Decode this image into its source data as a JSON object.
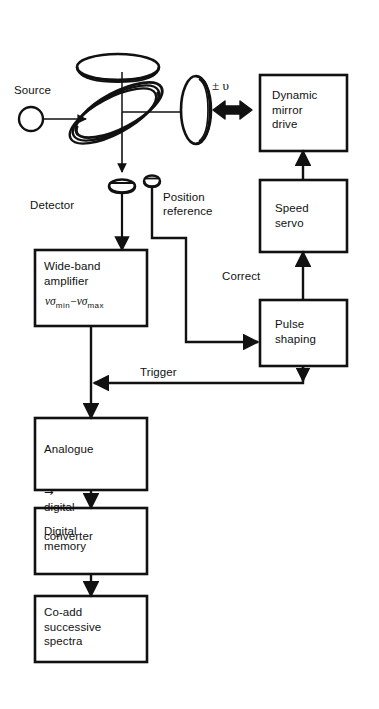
{
  "figure": {
    "background": "#ffffff",
    "line_color": "#111111"
  },
  "optics": {
    "source": {
      "label": "Source",
      "icon": "source-circle-icon"
    },
    "beamsplitter": {
      "icon": "beamsplitter-disc-icon"
    },
    "fixed_mirror": {
      "icon": "fixed-mirror-disc-icon"
    },
    "moving_mirror": {
      "icon": "moving-mirror-disc-icon"
    },
    "velocity_label": {
      "sign": "±",
      "symbol": "υ",
      "text": "± υ"
    },
    "scan_arrow": {
      "icon": "double-headed-arrow-icon"
    },
    "detector": {
      "label": "Detector",
      "icon": "detector-icon"
    },
    "position_reference": {
      "label": "Position\nreference",
      "icon": "position-reference-icon"
    }
  },
  "blocks": [
    {
      "id": "wide-band-amplifier",
      "label": "Wide-band\namplifier",
      "formula": {
        "left_symbol": "νσ",
        "left_sub": "min",
        "operator": "−",
        "right_symbol": "νσ",
        "right_sub": "max",
        "text": "νσmin−νσmax"
      }
    },
    {
      "id": "analogue-digital-converter",
      "label": "Analogue\n→ digital\nconverter",
      "line1": "Analogue",
      "line2_arrow": "→",
      "line2_text": "digital",
      "line3": "converter"
    },
    {
      "id": "digital-memory",
      "label": "Digital\nmemory"
    },
    {
      "id": "co-add-successive-spectra",
      "label": "Co-add\nsuccessive\nspectra"
    },
    {
      "id": "dynamic-mirror-drive",
      "label": "Dynamic\nmirror\ndrive"
    },
    {
      "id": "speed-servo",
      "label": "Speed\nservo"
    },
    {
      "id": "pulse-shaping",
      "label": "Pulse\nshaping"
    }
  ],
  "connections": [
    {
      "id": "trigger",
      "label": "Trigger",
      "from": "pulse-shaping",
      "to": "amplifier-output-line"
    },
    {
      "id": "correct",
      "label": "Correct",
      "from": "pulse-shaping",
      "to": "speed-servo"
    },
    {
      "id": "position-to-pulse",
      "label": "",
      "from": "position-reference",
      "to": "pulse-shaping"
    },
    {
      "id": "servo-to-drive",
      "label": "",
      "from": "speed-servo",
      "to": "dynamic-mirror-drive"
    },
    {
      "id": "detector-to-amp",
      "label": "",
      "from": "detector",
      "to": "wide-band-amplifier"
    },
    {
      "id": "amp-to-adc",
      "label": "",
      "from": "wide-band-amplifier",
      "to": "analogue-digital-converter"
    },
    {
      "id": "adc-to-memory",
      "label": "",
      "from": "analogue-digital-converter",
      "to": "digital-memory"
    },
    {
      "id": "memory-to-coadd",
      "label": "",
      "from": "digital-memory",
      "to": "co-add-successive-spectra"
    },
    {
      "id": "source-to-beamsplitter",
      "label": "",
      "from": "source",
      "to": "beamsplitter"
    }
  ]
}
